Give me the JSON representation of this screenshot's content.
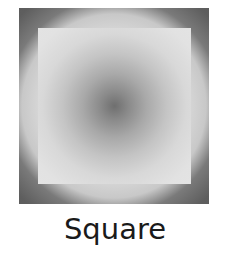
{
  "figure": {
    "shape_name": "Square",
    "outer_color": "#5e5e5e",
    "inner_light_color": "#e2e2e2",
    "center_color": "#6f6f6f",
    "description_caption": "Square"
  },
  "label": {
    "text": "Square"
  }
}
